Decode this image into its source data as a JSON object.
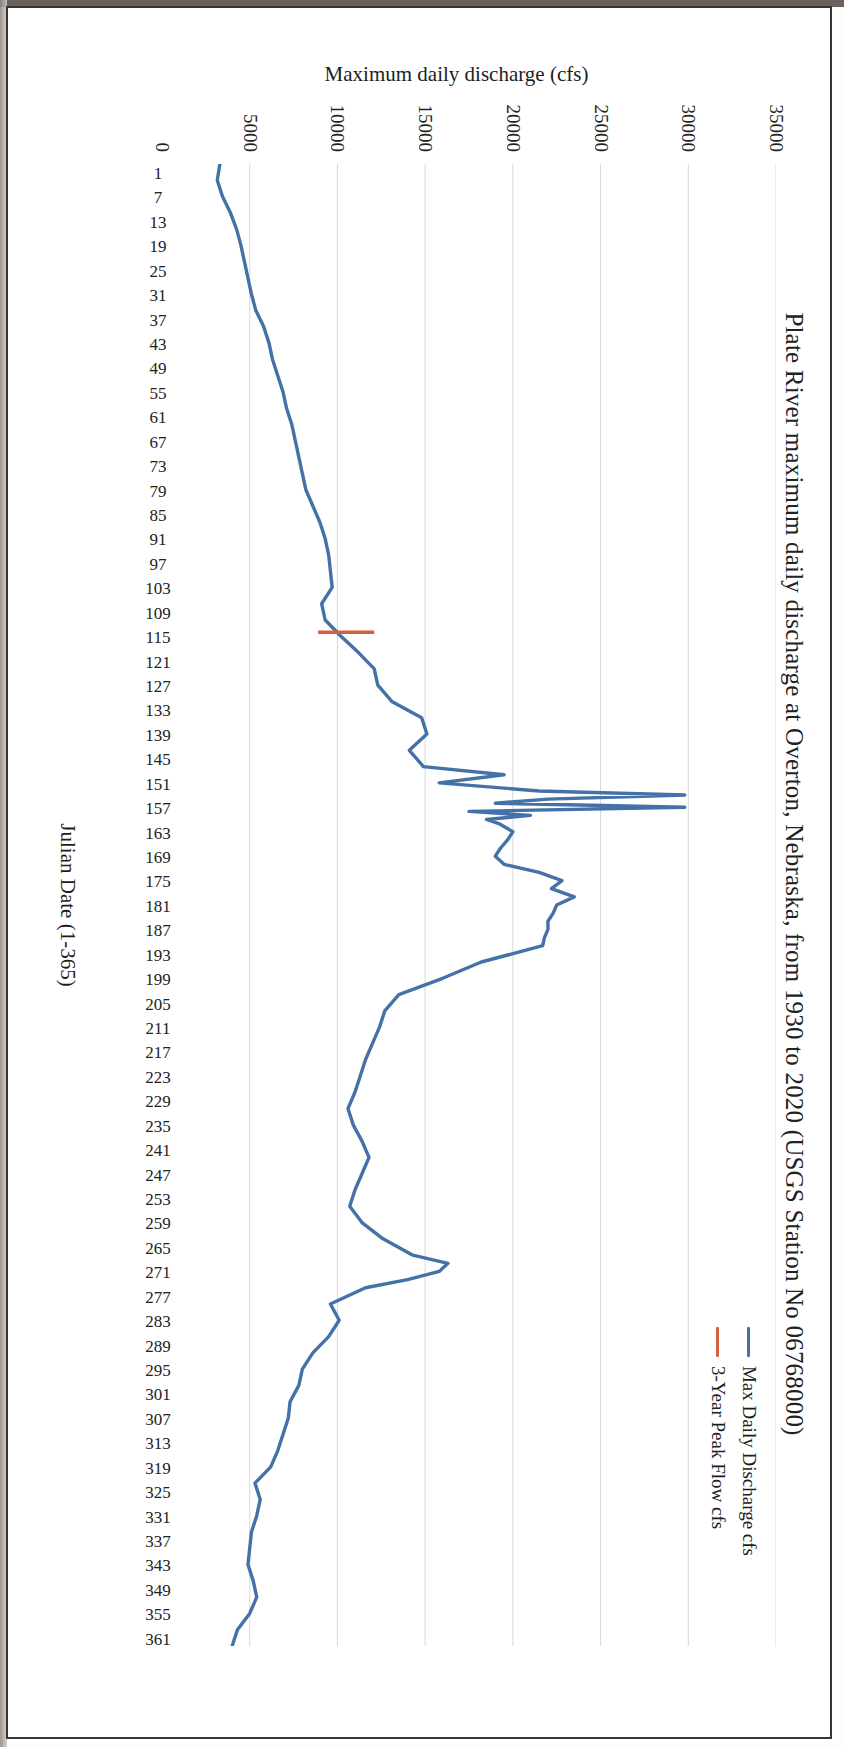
{
  "figure": {
    "title": "Plate River maximum daily discharge at Overton, Nebraska, from 1930 to 2020 (USGS Station No 06768000)"
  },
  "chart_data": {
    "type": "line",
    "title": "Plate River maximum daily discharge at Overton, Nebraska, from 1930 to 2020 (USGS Station No 06768000)",
    "xlabel": "Julian Date (1-365)",
    "ylabel": "Maximum daily discharge (cfs)",
    "xlim": [
      1,
      365
    ],
    "ylim": [
      0,
      35000
    ],
    "grid": "vertical-only",
    "legend_position": "top-right",
    "y_ticks": [
      "0",
      "5000",
      "10000",
      "15000",
      "20000",
      "25000",
      "30000",
      "35000"
    ],
    "y_tick_values": [
      0,
      5000,
      10000,
      15000,
      20000,
      25000,
      30000,
      35000
    ],
    "x_ticks": [
      "1",
      "7",
      "13",
      "19",
      "25",
      "31",
      "37",
      "43",
      "49",
      "55",
      "61",
      "67",
      "73",
      "79",
      "85",
      "91",
      "97",
      "103",
      "109",
      "115",
      "121",
      "127",
      "133",
      "139",
      "145",
      "151",
      "157",
      "163",
      "169",
      "175",
      "181",
      "187",
      "193",
      "199",
      "205",
      "211",
      "217",
      "223",
      "229",
      "235",
      "241",
      "247",
      "253",
      "259",
      "265",
      "271",
      "277",
      "283",
      "289",
      "295",
      "301",
      "307",
      "313",
      "319",
      "325",
      "331",
      "337",
      "343",
      "349",
      "355",
      "361"
    ],
    "series": [
      {
        "name": "Max Daily Discharge cfs",
        "color": "#4472a8",
        "x": [
          1,
          5,
          9,
          13,
          17,
          21,
          25,
          29,
          33,
          37,
          41,
          45,
          49,
          53,
          57,
          61,
          65,
          69,
          73,
          77,
          81,
          85,
          89,
          93,
          97,
          101,
          105,
          109,
          113,
          117,
          121,
          125,
          129,
          133,
          137,
          141,
          145,
          149,
          151,
          153,
          155,
          156,
          157,
          158,
          159,
          160,
          161,
          162,
          163,
          165,
          167,
          169,
          171,
          173,
          175,
          177,
          179,
          181,
          183,
          185,
          187,
          189,
          191,
          193,
          197,
          201,
          205,
          209,
          213,
          217,
          221,
          225,
          229,
          233,
          237,
          241,
          245,
          249,
          253,
          257,
          261,
          265,
          269,
          271,
          273,
          275,
          277,
          281,
          285,
          289,
          293,
          297,
          301,
          305,
          309,
          313,
          317,
          321,
          325,
          329,
          333,
          337,
          341,
          345,
          349,
          353,
          357,
          361,
          365
        ],
        "y": [
          3300,
          3150,
          3450,
          3900,
          4250,
          4500,
          4700,
          4900,
          5100,
          5350,
          5800,
          6100,
          6300,
          6600,
          6900,
          7100,
          7400,
          7600,
          7800,
          8000,
          8200,
          8600,
          9000,
          9300,
          9500,
          9600,
          9700,
          9100,
          9300,
          10200,
          11200,
          12100,
          12300,
          13100,
          14800,
          15100,
          14100,
          14900,
          19500,
          15800,
          21500,
          29800,
          22000,
          19000,
          29800,
          17500,
          21000,
          18500,
          19200,
          20000,
          19700,
          19300,
          19000,
          19500,
          21500,
          22800,
          22200,
          23500,
          22500,
          22300,
          22000,
          22000,
          21800,
          21700,
          18200,
          16000,
          13500,
          12700,
          12400,
          12000,
          11600,
          11300,
          11000,
          10600,
          10900,
          11400,
          11800,
          11400,
          11000,
          10700,
          11400,
          12600,
          14300,
          16300,
          15800,
          14000,
          11600,
          9600,
          10100,
          9500,
          8600,
          8000,
          7800,
          7300,
          7200,
          6900,
          6600,
          6200,
          5300,
          5600,
          5400,
          5100,
          5000,
          4900,
          5200,
          5400,
          5000,
          4300,
          4000
        ]
      },
      {
        "name": "3-Year Peak Flow cfs",
        "color": "#d4603f",
        "type": "vertical-marker",
        "x": 116,
        "y_from": 8900,
        "y_to": 12100,
        "value": 11200
      }
    ]
  },
  "legend": {
    "items": [
      {
        "label": "Max Daily Discharge cfs",
        "color": "#4472a8"
      },
      {
        "label": "3-Year Peak Flow cfs",
        "color": "#d4603f"
      }
    ]
  },
  "axes": {
    "x_title": "Julian Date (1-365)",
    "y_title": "Maximum daily discharge (cfs)"
  }
}
